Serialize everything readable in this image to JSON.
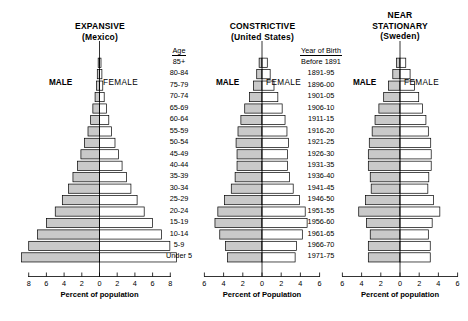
{
  "figure": {
    "kind": "population-pyramid-trio",
    "male_label": "MALE",
    "female_label": "FEMALE"
  },
  "age_column": {
    "header": "Age",
    "labels": [
      "85+",
      "80-84",
      "75-79",
      "70-74",
      "65-69",
      "60-64",
      "55-59",
      "50-54",
      "45-49",
      "40-44",
      "35-39",
      "30-34",
      "25-29",
      "20-24",
      "15-19",
      "10-14",
      "5-9",
      "Under 5"
    ]
  },
  "birth_column": {
    "header": "Year of Birth",
    "labels": [
      "Before 1891",
      "1891-95",
      "1896-00",
      "1901-05",
      "1906-10",
      "1911-15",
      "1916-20",
      "1921-25",
      "1926-30",
      "1931-35",
      "1936-40",
      "1941-45",
      "1946-50",
      "1951-55",
      "1956-60",
      "1961-65",
      "1966-70",
      "1971-75"
    ]
  },
  "panels": [
    {
      "id": "mexico",
      "title": "EXPANSIVE",
      "subtitle": "(Mexico)",
      "axis_caption": "Percent of population",
      "ticks": [
        8,
        6,
        4,
        2,
        0,
        2,
        4,
        6,
        8
      ]
    },
    {
      "id": "united-states",
      "title": "CONSTRICTIVE",
      "subtitle": "(United States)",
      "axis_caption": "Percent of Population",
      "ticks": [
        6,
        4,
        2,
        0,
        2,
        4,
        6
      ]
    },
    {
      "id": "sweden",
      "title": "NEAR STATIONARY",
      "title_line1": "NEAR",
      "title_line2": "STATIONARY",
      "subtitle": "(Sweden)",
      "axis_caption": "Percent of population",
      "ticks": [
        6,
        4,
        2,
        0,
        2,
        4,
        6
      ]
    }
  ],
  "colors": {
    "male_fill": "#c9c9c9",
    "female_fill": "#ffffff",
    "outline": "#000000",
    "background": "#ffffff"
  },
  "chart_data": [
    {
      "type": "bar",
      "id": "mexico",
      "title": "EXPANSIVE (Mexico)",
      "xlabel": "Percent of population",
      "ylabel": "Age",
      "xlim": [
        -9,
        9
      ],
      "xticks": [
        8,
        6,
        4,
        2,
        0,
        2,
        4,
        6,
        8
      ],
      "grid": false,
      "legend": [
        "MALE",
        "FEMALE"
      ],
      "categories": [
        "85+",
        "80-84",
        "75-79",
        "70-74",
        "65-69",
        "60-64",
        "55-59",
        "50-54",
        "45-49",
        "40-44",
        "35-39",
        "30-34",
        "25-29",
        "20-24",
        "15-19",
        "10-14",
        "5-9",
        "Under 5"
      ],
      "series": [
        {
          "name": "MALE",
          "values": [
            0.15,
            0.25,
            0.35,
            0.5,
            0.75,
            1.0,
            1.3,
            1.7,
            2.1,
            2.5,
            3.0,
            3.5,
            4.2,
            5.0,
            6.0,
            7.0,
            8.0,
            8.8
          ]
        },
        {
          "name": "FEMALE",
          "values": [
            0.17,
            0.27,
            0.37,
            0.53,
            0.78,
            1.05,
            1.35,
            1.75,
            2.15,
            2.55,
            3.05,
            3.55,
            4.25,
            5.05,
            6.0,
            7.0,
            7.95,
            8.7
          ]
        }
      ]
    },
    {
      "type": "bar",
      "id": "united-states",
      "title": "CONSTRICTIVE (United States)",
      "xlabel": "Percent of Population",
      "ylabel": "Age",
      "xlim": [
        -7,
        7
      ],
      "xticks": [
        6,
        4,
        2,
        0,
        2,
        4,
        6
      ],
      "grid": false,
      "legend": [
        "MALE",
        "FEMALE"
      ],
      "categories": [
        "85+",
        "80-84",
        "75-79",
        "70-74",
        "65-69",
        "60-64",
        "55-59",
        "50-54",
        "45-49",
        "40-44",
        "35-39",
        "30-34",
        "25-29",
        "20-24",
        "15-19",
        "10-14",
        "5-9",
        "Under 5"
      ],
      "series": [
        {
          "name": "MALE",
          "values": [
            0.3,
            0.55,
            0.9,
            1.3,
            1.8,
            2.2,
            2.5,
            2.7,
            2.6,
            2.6,
            2.8,
            3.2,
            3.9,
            4.6,
            4.9,
            4.4,
            3.8,
            3.6
          ]
        },
        {
          "name": "FEMALE",
          "values": [
            0.55,
            0.85,
            1.25,
            1.65,
            2.1,
            2.4,
            2.6,
            2.75,
            2.65,
            2.65,
            2.85,
            3.25,
            3.9,
            4.5,
            4.7,
            4.2,
            3.6,
            3.45
          ]
        }
      ]
    },
    {
      "type": "bar",
      "id": "sweden",
      "title": "NEAR STATIONARY (Sweden)",
      "xlabel": "Percent of population",
      "ylabel": "Age",
      "xlim": [
        -7,
        7
      ],
      "xticks": [
        6,
        4,
        2,
        0,
        2,
        4,
        6
      ],
      "grid": false,
      "legend": [
        "MALE",
        "FEMALE"
      ],
      "categories": [
        "85+",
        "80-84",
        "75-79",
        "70-74",
        "65-69",
        "60-64",
        "55-59",
        "50-54",
        "45-49",
        "40-44",
        "35-39",
        "30-34",
        "25-29",
        "20-24",
        "15-19",
        "10-14",
        "5-9",
        "Under 5"
      ],
      "series": [
        {
          "name": "MALE",
          "values": [
            0.35,
            0.75,
            1.2,
            1.7,
            2.2,
            2.6,
            2.9,
            3.2,
            3.3,
            3.3,
            3.1,
            3.0,
            3.6,
            4.3,
            3.5,
            3.1,
            3.3,
            3.3
          ]
        },
        {
          "name": "FEMALE",
          "values": [
            0.6,
            1.05,
            1.5,
            1.95,
            2.35,
            2.7,
            2.95,
            3.2,
            3.25,
            3.25,
            3.0,
            2.9,
            3.5,
            4.15,
            3.35,
            2.95,
            3.15,
            3.15
          ]
        }
      ]
    }
  ]
}
